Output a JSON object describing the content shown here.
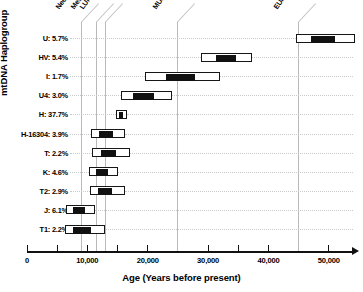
{
  "chart_data": {
    "type": "bar",
    "title": "",
    "xlabel": "Age (Years before present)",
    "ylabel": "mtDNA Haplogroup",
    "xlim": [
      0,
      54000
    ],
    "xticks": [
      0,
      10000,
      20000,
      30000,
      40000,
      50000
    ],
    "xticklabels": [
      "0",
      "10,000",
      "20,000",
      "30,000",
      "40,000",
      "50,000"
    ],
    "grid": "dotted horizontal leaders per row; solid vertical era guides",
    "legend": "none",
    "bar_style": "floating range bars: white box = outer confidence interval, black box = inner estimate range",
    "categories": [
      "U: 5.7%",
      "HV: 5.4%",
      "I: 1.7%",
      "U4: 3.0%",
      "H: 37.7%",
      "H-16304: 3.9%",
      "T: 2.2%",
      "K: 4.6%",
      "T2: 2.9%",
      "J: 6.1%",
      "T1: 2.2%"
    ],
    "rows": [
      {
        "label": "U: 5.7%",
        "haplogroup": "U",
        "percent": "5.7%",
        "outer_low": 44500,
        "outer_high": 54300,
        "inner_low": 47100,
        "inner_high": 51000
      },
      {
        "label": "HV: 5.4%",
        "haplogroup": "HV",
        "percent": "5.4%",
        "outer_low": 28800,
        "outer_high": 37200,
        "inner_low": 31300,
        "inner_high": 34600
      },
      {
        "label": "I: 1.7%",
        "haplogroup": "I",
        "percent": "1.7%",
        "outer_low": 19500,
        "outer_high": 32000,
        "inner_low": 23000,
        "inner_high": 27900
      },
      {
        "label": "U4: 3.0%",
        "haplogroup": "U4",
        "percent": "3.0%",
        "outer_low": 15500,
        "outer_high": 24000,
        "inner_low": 17500,
        "inner_high": 21100
      },
      {
        "label": "H: 37.7%",
        "haplogroup": "H",
        "percent": "37.7%",
        "outer_low": 14700,
        "outer_high": 16500,
        "inner_low": 15300,
        "inner_high": 15900
      },
      {
        "label": "H-16304: 3.9%",
        "haplogroup": "H-16304",
        "percent": "3.9%",
        "outer_low": 10600,
        "outer_high": 16300,
        "inner_low": 12000,
        "inner_high": 14300
      },
      {
        "label": "T: 2.2%",
        "haplogroup": "T",
        "percent": "2.2%",
        "outer_low": 10800,
        "outer_high": 17000,
        "inner_low": 12200,
        "inner_high": 14800
      },
      {
        "label": "K: 4.6%",
        "haplogroup": "K",
        "percent": "4.6%",
        "outer_low": 10300,
        "outer_high": 15100,
        "inner_low": 11500,
        "inner_high": 13400
      },
      {
        "label": "T2: 2.9%",
        "haplogroup": "T2",
        "percent": "2.9%",
        "outer_low": 10400,
        "outer_high": 16300,
        "inner_low": 11700,
        "inner_high": 14100
      },
      {
        "label": "J: 6.1%",
        "haplogroup": "J",
        "percent": "6.1%",
        "outer_low": 6500,
        "outer_high": 11300,
        "inner_low": 7600,
        "inner_high": 9600
      },
      {
        "label": "T1: 2.2%",
        "haplogroup": "T1",
        "percent": "2.2%",
        "outer_low": 6300,
        "outer_high": 13000,
        "inner_low": 7700,
        "inner_high": 10600
      }
    ],
    "era_markers": [
      {
        "name": "Neolithic",
        "age": 9000
      },
      {
        "name": "Mesolithic",
        "age": 11500
      },
      {
        "name": "LUP",
        "age": 13000
      },
      {
        "name": "MUP",
        "age": 25000
      },
      {
        "name": "EUP",
        "age": 45000
      }
    ]
  },
  "colors": {
    "bar_fill": "#ffffff",
    "bar_stroke": "#161616",
    "bar_inner": "#111111",
    "guide": "#b9b9b9",
    "leader": "#c9c9c9",
    "axis": "#111111",
    "background": "#ffffff"
  }
}
